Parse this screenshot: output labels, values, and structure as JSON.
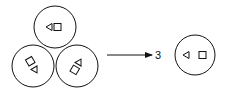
{
  "diagram": {
    "left_group": {
      "circles": [
        {
          "position": "top",
          "glyphs": [
            "triangle-left",
            "square"
          ],
          "orientation_deg": 0
        },
        {
          "position": "bottom-left",
          "glyphs": [
            "square",
            "triangle"
          ],
          "orientation_deg": -60
        },
        {
          "position": "bottom-right",
          "glyphs": [
            "triangle",
            "square"
          ],
          "orientation_deg": 60
        }
      ]
    },
    "arrow": {
      "direction": "right"
    },
    "multiplier_label": "3",
    "right_circle": {
      "glyphs": [
        "triangle-left",
        "square"
      ]
    },
    "colors": {
      "stroke": "#111111",
      "background": "#ffffff"
    }
  }
}
